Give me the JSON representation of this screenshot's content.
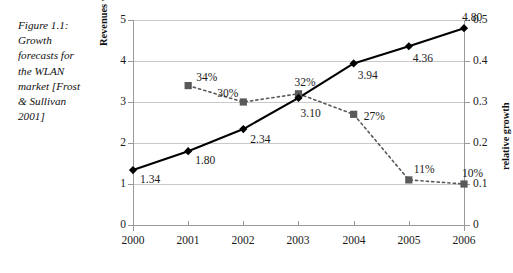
{
  "caption": {
    "text": "Figure 1.1:\nGrowth\nforecasts for\nthe WLAN\nmarket [Frost\n& Sullivan\n2001]"
  },
  "chart_data": {
    "type": "line",
    "title": "",
    "xlabel": "",
    "categories": [
      "2000",
      "2001",
      "2002",
      "2003",
      "2004",
      "2005",
      "2006"
    ],
    "grid": true,
    "legend": "none",
    "axes": {
      "left": {
        "label": "Revenues world-wide (US $ billions)",
        "ticks": [
          "0",
          "1",
          "2",
          "3",
          "4",
          "5"
        ],
        "tick_values": [
          0,
          1,
          2,
          3,
          4,
          5
        ],
        "ylim": [
          0,
          5
        ]
      },
      "right": {
        "label": "relative growth",
        "ticks": [
          "0",
          "0.1",
          "0.2",
          "0.3",
          "0.4",
          "0.5"
        ],
        "tick_values": [
          0,
          0.1,
          0.2,
          0.3,
          0.4,
          0.5
        ],
        "ylim": [
          0,
          0.5
        ]
      }
    },
    "series": [
      {
        "name": "Revenues world-wide (US $ billions)",
        "axis": "left",
        "style": "solid",
        "marker": "diamond",
        "color": "#000000",
        "x": [
          "2000",
          "2001",
          "2002",
          "2003",
          "2004",
          "2005",
          "2006"
        ],
        "values": [
          1.34,
          1.8,
          2.34,
          3.1,
          3.94,
          4.36,
          4.8
        ],
        "labels": [
          "1.34",
          "1.80",
          "2.34",
          "3.10",
          "3.94",
          "4.36",
          "4.80"
        ]
      },
      {
        "name": "relative growth",
        "axis": "right",
        "style": "dotted",
        "marker": "square",
        "color": "#595959",
        "x": [
          "2001",
          "2002",
          "2003",
          "2004",
          "2005",
          "2006"
        ],
        "values": [
          0.34,
          0.3,
          0.32,
          0.27,
          0.11,
          0.1
        ],
        "labels": [
          "34%",
          "30%",
          "32%",
          "27%",
          "11%",
          "10%"
        ]
      }
    ]
  },
  "colors": {
    "revenue_line": "#000000",
    "growth_line": "#595959",
    "gridline": "#c9c9c9",
    "axis": "#9a9a9a",
    "background": "#ffffff"
  }
}
